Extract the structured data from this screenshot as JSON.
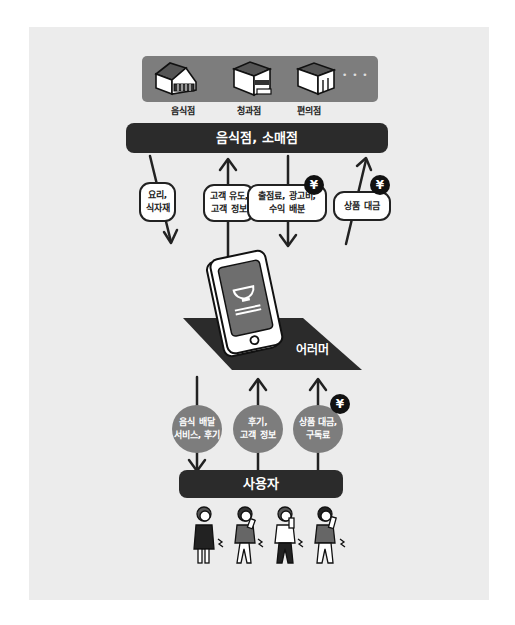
{
  "diagram": {
    "stores": {
      "items": [
        {
          "label": "음식점",
          "icon": "restaurant-building-icon"
        },
        {
          "label": "청과점",
          "icon": "grocery-building-icon"
        },
        {
          "label": "편의점",
          "icon": "convenience-store-building-icon"
        }
      ],
      "more": "• • •"
    },
    "top_bar": {
      "label": "음식점, 소매점"
    },
    "upper_flows": [
      {
        "label_line1": "요리,",
        "label_line2": "식자재",
        "direction": "down",
        "yen": false
      },
      {
        "label_line1": "고객 유도,",
        "label_line2": "고객 정보",
        "direction": "up",
        "yen": false
      },
      {
        "label_line1": "출점료, 광고비,",
        "label_line2": "수익 배분",
        "direction": "down",
        "yen": true
      },
      {
        "label_line1": "상품 대금",
        "label_line2": "",
        "direction": "up",
        "yen": true
      }
    ],
    "platform": {
      "label": "어러머",
      "icon": "smartphone-bowl-icon"
    },
    "lower_flows": [
      {
        "label_line1": "음식 배달",
        "label_line2": "서비스, 후기",
        "direction": "down",
        "yen": false
      },
      {
        "label_line1": "후기,",
        "label_line2": "고객 정보",
        "direction": "up",
        "yen": false
      },
      {
        "label_line1": "상품 대금,",
        "label_line2": "구독료",
        "direction": "up",
        "yen": true
      }
    ],
    "bottom_bar": {
      "label": "사용자"
    },
    "yen_symbol": "¥",
    "users_count": 4,
    "colors": {
      "panel_bg": "#ececec",
      "dark_bar": "#2b2b2b",
      "store_strip": "#7d7d7d",
      "circle_fill": "#7d7d7d",
      "yen_badge": "#111111"
    }
  }
}
